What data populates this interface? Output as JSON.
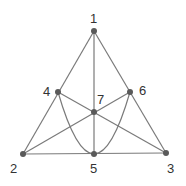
{
  "diagram": {
    "type": "fano-plane",
    "colors": {
      "line": "#7a7a7a",
      "point": "#5a5a5a",
      "label": "#333333",
      "background": "#ffffff"
    },
    "points": [
      {
        "id": "1",
        "label": "1",
        "x": 94,
        "y": 31
      },
      {
        "id": "2",
        "label": "2",
        "x": 23,
        "y": 154
      },
      {
        "id": "3",
        "label": "3",
        "x": 166,
        "y": 153
      },
      {
        "id": "4",
        "label": "4",
        "x": 58,
        "y": 92
      },
      {
        "id": "5",
        "label": "5",
        "x": 94,
        "y": 154
      },
      {
        "id": "6",
        "label": "6",
        "x": 130,
        "y": 92
      },
      {
        "id": "7",
        "label": "7",
        "x": 94,
        "y": 112
      }
    ],
    "lines": [
      [
        "1",
        "4",
        "2"
      ],
      [
        "1",
        "6",
        "3"
      ],
      [
        "2",
        "5",
        "3"
      ],
      [
        "1",
        "7",
        "5"
      ],
      [
        "2",
        "7",
        "6"
      ],
      [
        "3",
        "7",
        "4"
      ],
      [
        "4",
        "5",
        "6"
      ]
    ]
  }
}
